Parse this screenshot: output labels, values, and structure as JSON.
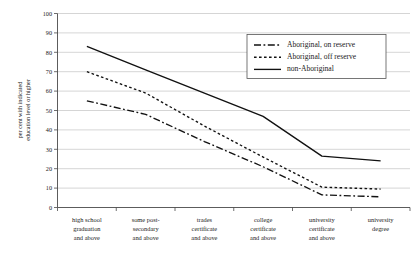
{
  "chart_data": {
    "type": "line",
    "title": "",
    "subtitle": "",
    "xlabel": "",
    "ylabel": "per cent with indicated\neducation level or higher",
    "ylabel_line1": "per cent with indicated",
    "ylabel_line2": "education level or higher",
    "ylim": [
      0,
      100
    ],
    "ytick_step": 10,
    "yticks": [
      0,
      10,
      20,
      30,
      40,
      50,
      60,
      70,
      80,
      90,
      100
    ],
    "grid": true,
    "grid_axis": "y",
    "legend_position": "top-right-inside",
    "categories": [
      "high school graduation and above",
      "some post-secondary and above",
      "trades certificate and above",
      "college certificate and above",
      "university certificate and above",
      "university degree"
    ],
    "category_label_lines": [
      [
        "high school",
        "graduation",
        "and above"
      ],
      [
        "some post-",
        "secondary",
        "and above"
      ],
      [
        "trades",
        "certificate",
        "and above"
      ],
      [
        "college",
        "certificate",
        "and above"
      ],
      [
        "university",
        "certificate",
        "and above"
      ],
      [
        "university",
        "degree"
      ]
    ],
    "series": [
      {
        "name": "Aboriginal, on reserve",
        "style": "dash-dot",
        "dash_pattern": "7,2.5,1.8,2.5",
        "color": "#111111",
        "values": [
          55,
          48,
          34,
          21,
          6.5,
          5.5
        ]
      },
      {
        "name": "Aboriginal, off reserve",
        "style": "dotted",
        "dash_pattern": "2.6,2.4",
        "color": "#111111",
        "values": [
          70,
          59,
          42,
          26,
          10.5,
          9.5
        ]
      },
      {
        "name": "non-Aboriginal",
        "style": "solid",
        "dash_pattern": "none",
        "color": "#111111",
        "values": [
          83,
          71,
          59,
          47,
          26.5,
          24
        ]
      }
    ]
  },
  "legend": {
    "entries": [
      "Aboriginal, on reserve",
      "Aboriginal, off reserve",
      "non-Aboriginal"
    ]
  }
}
